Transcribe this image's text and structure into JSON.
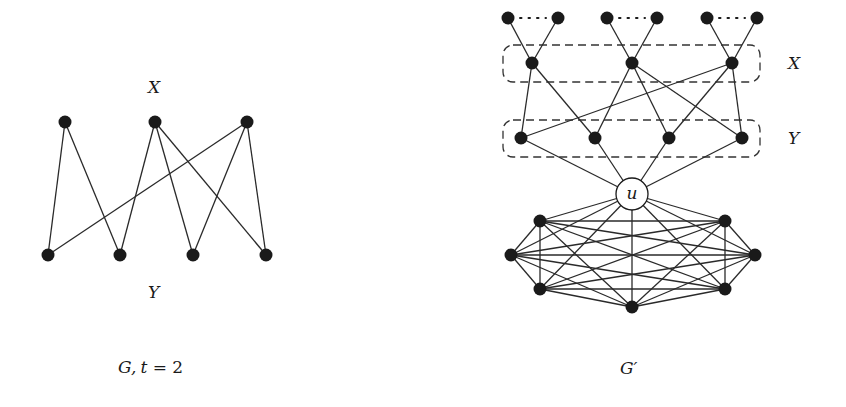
{
  "figure": {
    "left_graph": {
      "name": "G",
      "caption_italic": "G,",
      "caption_t": "t",
      "caption_rest": " = 2",
      "x_label": "X",
      "y_label": "Y",
      "x_nodes": [
        [
          65,
          122
        ],
        [
          155,
          122
        ],
        [
          247,
          122
        ]
      ],
      "y_nodes": [
        [
          48,
          255
        ],
        [
          120,
          255
        ],
        [
          193,
          255
        ],
        [
          266,
          255
        ]
      ],
      "edges": [
        [
          0,
          0
        ],
        [
          0,
          1
        ],
        [
          1,
          1
        ],
        [
          1,
          2
        ],
        [
          1,
          3
        ],
        [
          2,
          0
        ],
        [
          2,
          2
        ],
        [
          2,
          3
        ]
      ]
    },
    "right_graph": {
      "name": "G'",
      "caption": "G′",
      "x_label": "X",
      "y_label": "Y",
      "u_label": "u",
      "top_nodes": [
        [
          508,
          18
        ],
        [
          558,
          18
        ],
        [
          607,
          18
        ],
        [
          657,
          18
        ],
        [
          707,
          18
        ],
        [
          757,
          18
        ]
      ],
      "top_pairs_dotted": [
        [
          0,
          1
        ],
        [
          2,
          3
        ],
        [
          4,
          5
        ]
      ],
      "x_nodes": [
        [
          532,
          63
        ],
        [
          632,
          63
        ],
        [
          732,
          63
        ]
      ],
      "y_nodes": [
        [
          521,
          138
        ],
        [
          595,
          138
        ],
        [
          669,
          138
        ],
        [
          742,
          138
        ]
      ],
      "edges": [
        [
          0,
          0
        ],
        [
          0,
          1
        ],
        [
          1,
          1
        ],
        [
          1,
          2
        ],
        [
          1,
          3
        ],
        [
          2,
          0
        ],
        [
          2,
          2
        ],
        [
          2,
          3
        ]
      ],
      "u_node": [
        632,
        194
      ],
      "clique_nodes": [
        [
          540,
          221
        ],
        [
          725,
          221
        ],
        [
          511,
          255
        ],
        [
          755,
          255
        ],
        [
          540,
          289
        ],
        [
          725,
          289
        ],
        [
          632,
          307
        ]
      ],
      "x_box": [
        503,
        45,
        257,
        37
      ],
      "y_box": [
        503,
        120,
        257,
        37
      ]
    }
  }
}
